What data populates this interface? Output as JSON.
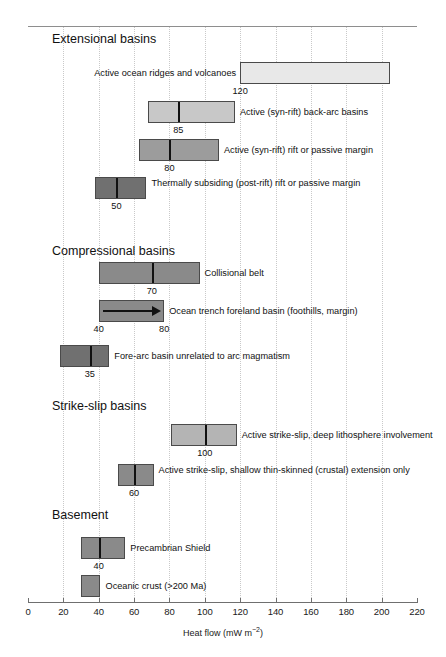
{
  "chart_data": {
    "type": "bar",
    "title": "",
    "xlabel": "Heat flow (mW m−2)",
    "ylabel": "",
    "xlim": [
      0,
      220
    ],
    "xticks": [
      0,
      20,
      40,
      60,
      80,
      100,
      120,
      140,
      160,
      180,
      200,
      220
    ],
    "grid": "vertical-dotted",
    "legend": "none",
    "orientation": "horizontal",
    "units": "mW m^-2",
    "sections": [
      {
        "heading": "Extensional basins",
        "items": [
          {
            "label": "Active ocean ridges and volcanoes",
            "range": [
              120,
              205
            ],
            "median": null,
            "value_labels": [
              {
                "text": "120",
                "at": 120
              }
            ],
            "fill": "#e8e8e8",
            "label_side": "left",
            "arrow": false
          },
          {
            "label": "Active (syn-rift) back-arc basins",
            "range": [
              68,
              117
            ],
            "median": 85,
            "value_labels": [
              {
                "text": "85",
                "at": 85
              }
            ],
            "fill": "#c8c8c8",
            "label_side": "right",
            "arrow": false
          },
          {
            "label": "Active (syn-rift) rift or passive margin",
            "range": [
              63,
              108
            ],
            "median": 80,
            "value_labels": [
              {
                "text": "80",
                "at": 80
              }
            ],
            "fill": "#9c9c9c",
            "label_side": "right",
            "arrow": false
          },
          {
            "label": "Thermally subsiding (post-rift) rift or passive margin",
            "range": [
              38,
              67
            ],
            "median": 50,
            "value_labels": [
              {
                "text": "50",
                "at": 50
              }
            ],
            "fill": "#707070",
            "label_side": "right",
            "arrow": false
          }
        ]
      },
      {
        "heading": "Compressional basins",
        "items": [
          {
            "label": "Collisional belt",
            "range": [
              40,
              97
            ],
            "median": 70,
            "value_labels": [
              {
                "text": "70",
                "at": 70
              }
            ],
            "fill": "#8a8a8a",
            "label_side": "right",
            "arrow": false
          },
          {
            "label": "Ocean trench foreland basin (foothills, margin)",
            "range": [
              40,
              77
            ],
            "median": null,
            "value_labels": [
              {
                "text": "40",
                "at": 40
              },
              {
                "text": "80",
                "at": 77
              }
            ],
            "fill": "#8a8a8a",
            "label_side": "right",
            "arrow": true
          },
          {
            "label": "Fore-arc basin unrelated to arc magmatism",
            "range": [
              18,
              46
            ],
            "median": 35,
            "value_labels": [
              {
                "text": "35",
                "at": 35
              }
            ],
            "fill": "#707070",
            "label_side": "right",
            "arrow": false
          }
        ]
      },
      {
        "heading": "Strike-slip basins",
        "items": [
          {
            "label": "Active strike-slip, deep lithosphere involvement",
            "range": [
              81,
              118
            ],
            "median": 100,
            "value_labels": [
              {
                "text": "100",
                "at": 100
              }
            ],
            "fill": "#b4b4b4",
            "label_side": "right",
            "arrow": false
          },
          {
            "label": "Active strike-slip, shallow thin-skinned (crustal) extension only",
            "range": [
              51,
              71
            ],
            "median": 60,
            "value_labels": [
              {
                "text": "60",
                "at": 60
              }
            ],
            "fill": "#8a8a8a",
            "label_side": "right",
            "arrow": false
          }
        ]
      },
      {
        "heading": "Basement",
        "items": [
          {
            "label": "Precambrian Shield",
            "range": [
              30,
              55
            ],
            "median": 40,
            "value_labels": [
              {
                "text": "40",
                "at": 40
              }
            ],
            "fill": "#8a8a8a",
            "label_side": "right",
            "arrow": false
          },
          {
            "label": "Oceanic crust (>200 Ma)",
            "range": [
              30,
              41
            ],
            "median": null,
            "value_labels": [],
            "fill": "#8a8a8a",
            "label_side": "right",
            "arrow": false
          }
        ]
      }
    ]
  }
}
